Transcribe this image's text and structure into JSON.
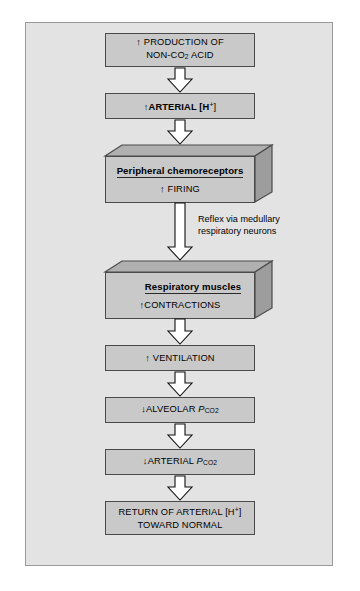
{
  "diagram": {
    "frame_background": "#e3e3e3",
    "box_fill": "#c9c9c9",
    "box_border": "#4a4a4a",
    "arrow_fill": "#ffffff",
    "arrow_stroke": "#111111",
    "nodes": [
      {
        "id": "production",
        "kind": "flat",
        "line1": "↑ PRODUCTION OF",
        "line2_prefix": "NON-CO",
        "line2_sub": "2",
        "line2_suffix": " ACID"
      },
      {
        "id": "arterial-h",
        "kind": "flat",
        "prefix": "↑ARTERIAL [H",
        "sup": "+",
        "suffix": "]"
      },
      {
        "id": "peripheral-chemoreceptors",
        "kind": "block3d",
        "title": "Peripheral chemoreceptors",
        "sub": "↑ FIRING"
      },
      {
        "id": "respiratory-muscles",
        "kind": "block3d",
        "title": "Respiratory muscles",
        "sub": "↑CONTRACTIONS"
      },
      {
        "id": "ventilation",
        "kind": "flat",
        "text": "↑ VENTILATION"
      },
      {
        "id": "alveolar-pco2",
        "kind": "flat",
        "prefix": "↓ALVEOLAR ",
        "symbol": "P",
        "sub": "CO",
        "sub2": "2"
      },
      {
        "id": "arterial-pco2",
        "kind": "flat",
        "prefix": "↓ARTERIAL  ",
        "symbol": "P",
        "sub": "CO",
        "sub2": "2"
      },
      {
        "id": "return-normal",
        "kind": "flat",
        "line1_prefix": "RETURN OF ARTERIAL [H",
        "line1_sup": "+",
        "line1_suffix": "]",
        "line2": "TOWARD NORMAL"
      }
    ],
    "captions": [
      {
        "id": "reflex-note",
        "line1": "Reflex via medullary",
        "line2": "respiratory neurons"
      }
    ]
  }
}
